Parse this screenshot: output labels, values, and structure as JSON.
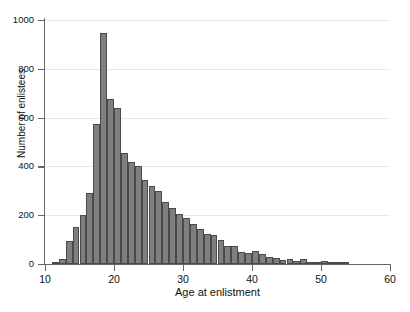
{
  "chart_data": {
    "type": "bar",
    "title": "",
    "xlabel": "Age at enlistment",
    "ylabel": "Number of enlistees",
    "xlim": [
      10,
      60
    ],
    "ylim": [
      0,
      1000
    ],
    "xticks": [
      10,
      20,
      30,
      40,
      50,
      60
    ],
    "yticks": [
      0,
      200,
      400,
      600,
      800,
      1000
    ],
    "grid": "horizontal",
    "legend": "none",
    "bin_width": 1,
    "bar_color": "#7f7f7f",
    "bar_edge_color": "#4a4a4a",
    "categories": [
      11,
      12,
      13,
      14,
      15,
      16,
      17,
      18,
      19,
      20,
      21,
      22,
      23,
      24,
      25,
      26,
      27,
      28,
      29,
      30,
      31,
      32,
      33,
      34,
      35,
      36,
      37,
      38,
      39,
      40,
      41,
      42,
      43,
      44,
      45,
      46,
      47,
      48,
      49,
      50,
      51,
      52,
      53
    ],
    "values": [
      8,
      20,
      95,
      150,
      200,
      290,
      575,
      945,
      675,
      640,
      455,
      420,
      400,
      345,
      320,
      300,
      255,
      230,
      205,
      190,
      165,
      145,
      125,
      120,
      100,
      75,
      72,
      48,
      45,
      55,
      40,
      30,
      25,
      18,
      20,
      12,
      20,
      10,
      6,
      14,
      5,
      3,
      2
    ]
  },
  "axis": {
    "y_tick_labels": [
      "0",
      "200",
      "400",
      "600",
      "800",
      "1000"
    ],
    "x_tick_labels": [
      "10",
      "20",
      "30",
      "40",
      "50",
      "60"
    ]
  }
}
